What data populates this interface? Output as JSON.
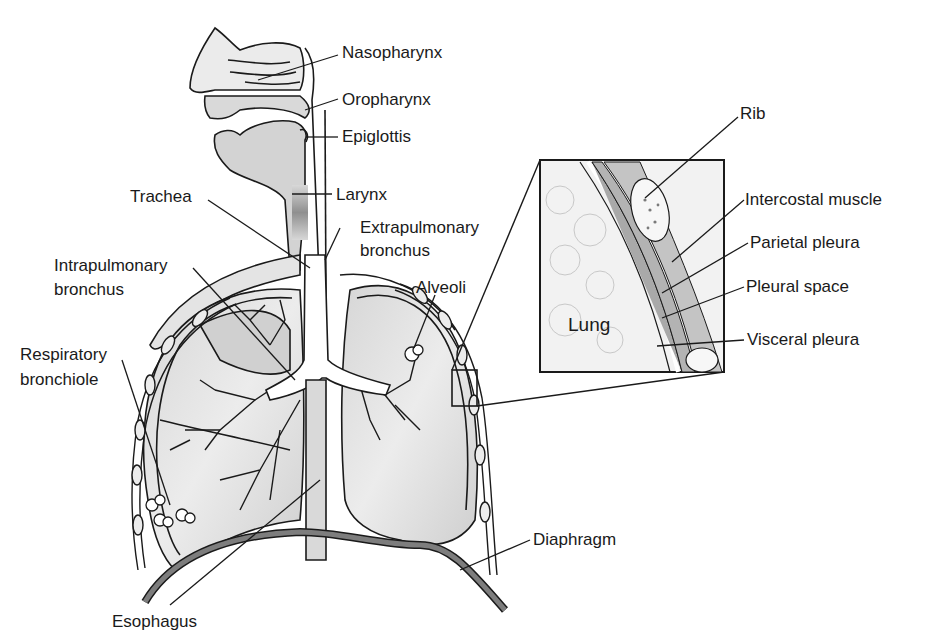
{
  "figure": {
    "type": "anatomical diagram"
  },
  "labels": {
    "nasopharynx": "Nasopharynx",
    "oropharynx": "Oropharynx",
    "epiglottis": "Epiglottis",
    "larynx": "Larynx",
    "trachea": "Trachea",
    "extrapulmonary_1": "Extrapulmonary",
    "extrapulmonary_2": "bronchus",
    "intrapulmonary_1": "Intrapulmonary",
    "intrapulmonary_2": "bronchus",
    "alveoli": "Alveoli",
    "respiratory_1": "Respiratory",
    "respiratory_2": "bronchiole",
    "esophagus": "Esophagus",
    "diaphragm": "Diaphragm"
  },
  "inset": {
    "lung": "Lung",
    "rib": "Rib",
    "intercostal_muscle": "Intercostal muscle",
    "parietal_pleura": "Parietal pleura",
    "pleural_space": "Pleural space",
    "visceral_pleura": "Visceral pleura"
  },
  "colors": {
    "line": "#1a1a1a",
    "fill_light": "#e2e2e2",
    "fill_mid": "#cfcfcf",
    "fill_dark": "#8a8a8a",
    "background": "#ffffff"
  }
}
